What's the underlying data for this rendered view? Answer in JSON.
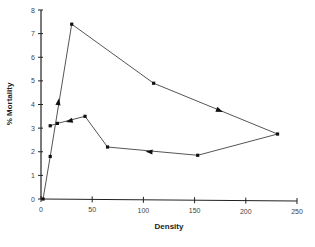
{
  "chart_data": {
    "type": "line",
    "title": "",
    "xlabel": "Density",
    "ylabel": "% Mortality",
    "xlim": [
      0,
      250
    ],
    "ylim": [
      0,
      8
    ],
    "xticks": [
      0,
      50,
      100,
      150,
      200,
      250
    ],
    "yticks": [
      0,
      1,
      2,
      3,
      4,
      5,
      6,
      7,
      8
    ],
    "grid": false,
    "legend": null,
    "series": [
      {
        "name": "trajectory",
        "points": [
          {
            "x": 2,
            "y": 0
          },
          {
            "x": 9,
            "y": 1.8
          },
          {
            "x": 30,
            "y": 7.4
          },
          {
            "x": 110,
            "y": 4.9
          },
          {
            "x": 231,
            "y": 2.75
          },
          {
            "x": 153,
            "y": 1.85
          },
          {
            "x": 65,
            "y": 2.2
          },
          {
            "x": 43,
            "y": 3.5
          },
          {
            "x": 16,
            "y": 3.2
          },
          {
            "x": 9,
            "y": 3.1
          }
        ],
        "direction_arrows": [
          {
            "x": 17,
            "y": 4.1
          },
          {
            "x": 174,
            "y": 3.75
          },
          {
            "x": 106,
            "y": 2.0
          },
          {
            "x": 28,
            "y": 3.3
          }
        ]
      }
    ]
  },
  "axes": {
    "x_title": "Density",
    "y_title": "% Mortality"
  }
}
